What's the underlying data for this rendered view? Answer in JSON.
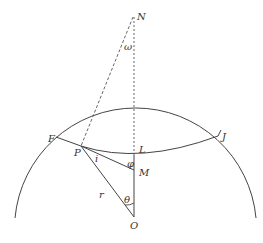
{
  "diagram": {
    "stroke_color": "#444444",
    "labels": {
      "N": "N",
      "omega": "ω",
      "F": "F",
      "P": "P",
      "i": "i",
      "L": "L",
      "J": "J",
      "phi": "φ",
      "M": "M",
      "r": "r",
      "theta": "θ",
      "O": "O"
    }
  }
}
